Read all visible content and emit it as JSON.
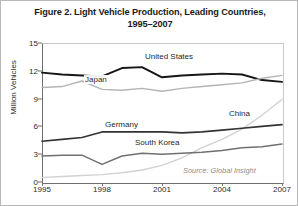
{
  "figure": {
    "title_line1": "Figure 2. Light Vehicle Production, Leading Countries,",
    "title_line2": "1995–2007",
    "source_note": "Source: Global Insight",
    "frame_color": "#b9b9b9",
    "background": "#ffffff"
  },
  "chart_data": {
    "type": "line",
    "title": "Figure 2. Light Vehicle Production, Leading Countries, 1995–2007",
    "xlabel": "",
    "ylabel": "Million Vehicles",
    "xlim": [
      1995,
      2007
    ],
    "ylim": [
      0,
      15
    ],
    "ytick_labels": [
      "0",
      "3",
      "6",
      "9",
      "12",
      "15"
    ],
    "ytick_values": [
      0,
      3,
      6,
      9,
      12,
      15
    ],
    "xtick_labels": [
      "1995",
      "1998",
      "2001",
      "2004",
      "2007"
    ],
    "xtick_values": [
      1995,
      1998,
      2001,
      2004,
      2007
    ],
    "grid": false,
    "legend": "inline-labels",
    "x": [
      1995,
      1996,
      1997,
      1998,
      1999,
      2000,
      2001,
      2002,
      2003,
      2004,
      2005,
      2006,
      2007
    ],
    "series": [
      {
        "name": "United States",
        "color": "#161616",
        "width": 1.9,
        "label_x_year": 2000.1,
        "label_y_value": 13.5,
        "values": [
          11.8,
          11.6,
          11.5,
          11.4,
          12.3,
          12.4,
          11.3,
          11.5,
          11.6,
          11.7,
          11.6,
          11.0,
          10.8
        ]
      },
      {
        "name": "Japan",
        "color": "#b4b4b4",
        "width": 1.4,
        "label_x_year": 1997.1,
        "label_y_value": 11.0,
        "values": [
          10.2,
          10.3,
          10.9,
          10.0,
          9.9,
          10.1,
          9.8,
          10.1,
          10.3,
          10.5,
          10.7,
          11.2,
          11.5
        ]
      },
      {
        "name": "China",
        "color": "#d2d2d2",
        "width": 1.4,
        "label_x_year": 2004.3,
        "label_y_value": 7.3,
        "values": [
          0.5,
          0.6,
          0.7,
          0.8,
          1.0,
          1.3,
          1.8,
          2.6,
          3.7,
          4.6,
          5.7,
          7.2,
          8.9
        ]
      },
      {
        "name": "Germany",
        "color": "#333333",
        "width": 1.7,
        "label_x_year": 1998.1,
        "label_y_value": 6.2,
        "values": [
          4.4,
          4.6,
          4.8,
          5.4,
          5.4,
          5.4,
          5.4,
          5.3,
          5.4,
          5.6,
          5.8,
          6.0,
          6.2
        ]
      },
      {
        "name": "South Korea",
        "color": "#707070",
        "width": 1.5,
        "label_x_year": 1999.6,
        "label_y_value": 4.2,
        "values": [
          2.8,
          2.9,
          2.9,
          1.9,
          2.8,
          3.1,
          3.0,
          3.1,
          3.2,
          3.4,
          3.7,
          3.8,
          4.1
        ]
      }
    ],
    "annotations": [
      {
        "text": "Source: Global Insight",
        "x_year": 2002.0,
        "y_value": 1.15,
        "style": "italic-gray"
      }
    ]
  }
}
